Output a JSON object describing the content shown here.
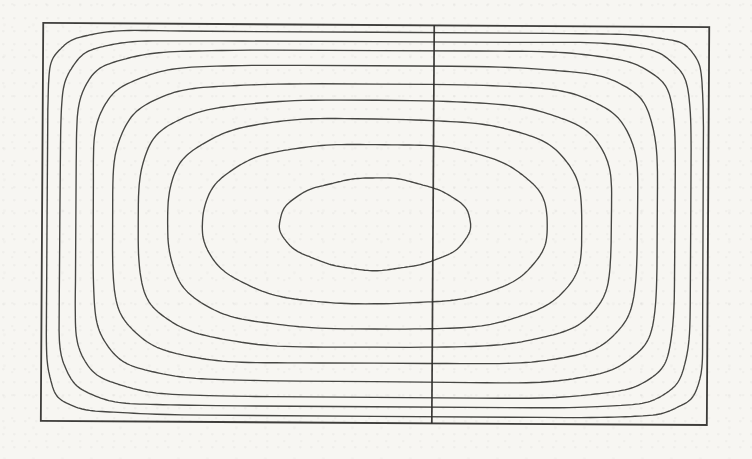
{
  "figure": {
    "kind": "scanned contour figure",
    "title": "",
    "caption": ""
  },
  "chart_data": {
    "type": "contour",
    "title": "",
    "xlabel": "",
    "ylabel": "",
    "grid": "off",
    "legend": "none",
    "frame": {
      "x1": 42,
      "y1": 25,
      "x2": 708,
      "y2": 423
    },
    "center": {
      "x": 375,
      "y": 224
    },
    "divider": {
      "x": 433,
      "y1": 25,
      "y2": 423
    },
    "n_contours": 9,
    "contours": [
      {
        "rx": 328,
        "ry": 192,
        "squareness": 11.0
      },
      {
        "rx": 315,
        "ry": 183,
        "squareness": 8.5
      },
      {
        "rx": 300,
        "ry": 173,
        "squareness": 6.8
      },
      {
        "rx": 282,
        "ry": 158,
        "squareness": 5.5
      },
      {
        "rx": 262,
        "ry": 140,
        "squareness": 4.6
      },
      {
        "rx": 237,
        "ry": 123,
        "squareness": 3.8
      },
      {
        "rx": 207,
        "ry": 105,
        "squareness": 3.1
      },
      {
        "rx": 172,
        "ry": 80,
        "squareness": 2.5
      },
      {
        "rx": 96,
        "ry": 46,
        "squareness": 2.0
      }
    ],
    "line_color": "#2e2d2a",
    "background_color": "#f7f6f2"
  }
}
